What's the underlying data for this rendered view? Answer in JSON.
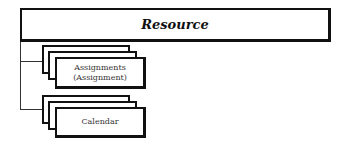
{
  "diagram": {
    "root": {
      "title": "Resource"
    },
    "children": [
      {
        "label_line1": "Assignments",
        "label_line2": "(Assignment)"
      },
      {
        "label_line1": "Calendar"
      }
    ]
  }
}
